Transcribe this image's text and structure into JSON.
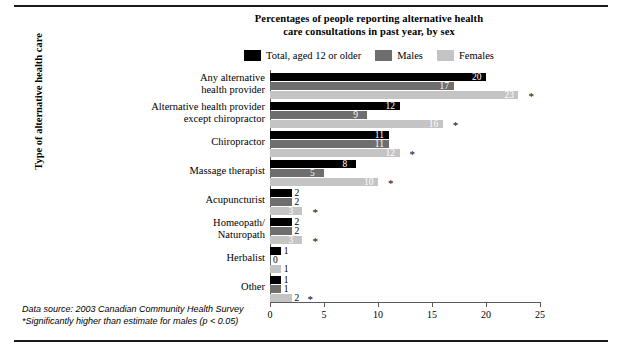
{
  "figure": {
    "title_line1": "Percentages of people reporting alternative health",
    "title_line2": "care consultations in past year, by sex",
    "source_note": "Data source: 2003 Canadian Community Health Survey",
    "significance_note": "*Significantly higher than estimate for males (p < 0.05)",
    "significance_marker": "*"
  },
  "colors": {
    "total": "#000000",
    "males": "#6e6e6e",
    "females": "#c4c4c4",
    "axis": "#5a5a5a",
    "rule": "#1a1a1a",
    "background": "#ffffff"
  },
  "legend": {
    "position": "top-center",
    "items": [
      {
        "label": "Total, aged 12 or older",
        "color": "#000000",
        "key": "total"
      },
      {
        "label": "Males",
        "color": "#6e6e6e",
        "key": "males"
      },
      {
        "label": "Females",
        "color": "#c4c4c4",
        "key": "females"
      }
    ]
  },
  "axes": {
    "x": {
      "label": "",
      "min": 0,
      "max": 25,
      "ticks": [
        "0",
        "5",
        "10",
        "15",
        "20",
        "25"
      ],
      "tick_values": [
        0,
        5,
        10,
        15,
        20,
        25
      ]
    },
    "y": {
      "label": "Type of alternative health care"
    }
  },
  "chart_data": {
    "type": "bar",
    "orientation": "horizontal",
    "grouped": true,
    "title": "Percentages of people reporting alternative health care consultations in past year, by sex",
    "xlabel": "",
    "ylabel": "Type of alternative health care",
    "xlim": [
      0,
      25
    ],
    "grid": false,
    "legend_position": "top-center",
    "categories": [
      "Any alternative health provider",
      "Alternative health provider except chiropractor",
      "Chiropractor",
      "Massage therapist",
      "Acupuncturist",
      "Homeopath/Naturopath",
      "Herbalist",
      "Other"
    ],
    "category_label_lines": [
      [
        "Any alternative",
        "health provider"
      ],
      [
        "Alternative health provider",
        "except chiropractor"
      ],
      [
        "Chiropractor"
      ],
      [
        "Massage therapist"
      ],
      [
        "Acupuncturist"
      ],
      [
        "Homeopath/",
        "Naturopath"
      ],
      [
        "Herbalist"
      ],
      [
        "Other"
      ]
    ],
    "series": [
      {
        "name": "Total, aged 12 or older",
        "color": "#000000",
        "values": [
          20,
          12,
          11,
          8,
          2,
          2,
          1,
          1
        ]
      },
      {
        "name": "Males",
        "color": "#6e6e6e",
        "values": [
          17,
          9,
          11,
          5,
          2,
          2,
          0,
          1
        ]
      },
      {
        "name": "Females",
        "color": "#c4c4c4",
        "values": [
          23,
          16,
          12,
          10,
          3,
          3,
          1,
          2
        ]
      }
    ],
    "significance_flags": [
      {
        "series": "Females",
        "categories": [
          "Any alternative health provider",
          "Alternative health provider except chiropractor",
          "Chiropractor",
          "Massage therapist",
          "Acupuncturist",
          "Homeopath/Naturopath",
          "Other"
        ]
      }
    ],
    "data_labels": {
      "Total, aged 12 or older": [
        "20",
        "12",
        "11",
        "8",
        "2",
        "2",
        "1",
        "1"
      ],
      "Males": [
        "17",
        "9",
        "11",
        "5",
        "2",
        "2",
        "0",
        "1"
      ],
      "Females": [
        "23",
        "16",
        "12",
        "10",
        "3",
        "3",
        "1",
        "2"
      ]
    }
  }
}
